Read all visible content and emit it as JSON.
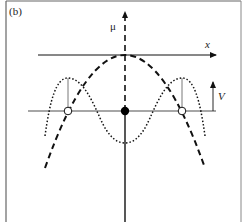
{
  "figure": {
    "panel_label": "(b)",
    "vertical_axis_label": "μ",
    "horizontal_axis_label": "x",
    "amplitude_label": "V",
    "colors": {
      "frame": "#555555",
      "axis": "#111111",
      "baseline": "#888888",
      "curve": "#111111",
      "background": "#ffffff"
    },
    "elements": [
      {
        "name": "dashed-parabola",
        "style": "dashed",
        "description": "downward parabola peaking at x-axis crossing"
      },
      {
        "name": "dotted-potential",
        "style": "dotted",
        "description": "double-hump curve with central trough"
      },
      {
        "name": "center-point",
        "style": "filled-circle"
      },
      {
        "name": "side-points",
        "style": "open-circle",
        "count": 2
      }
    ]
  }
}
